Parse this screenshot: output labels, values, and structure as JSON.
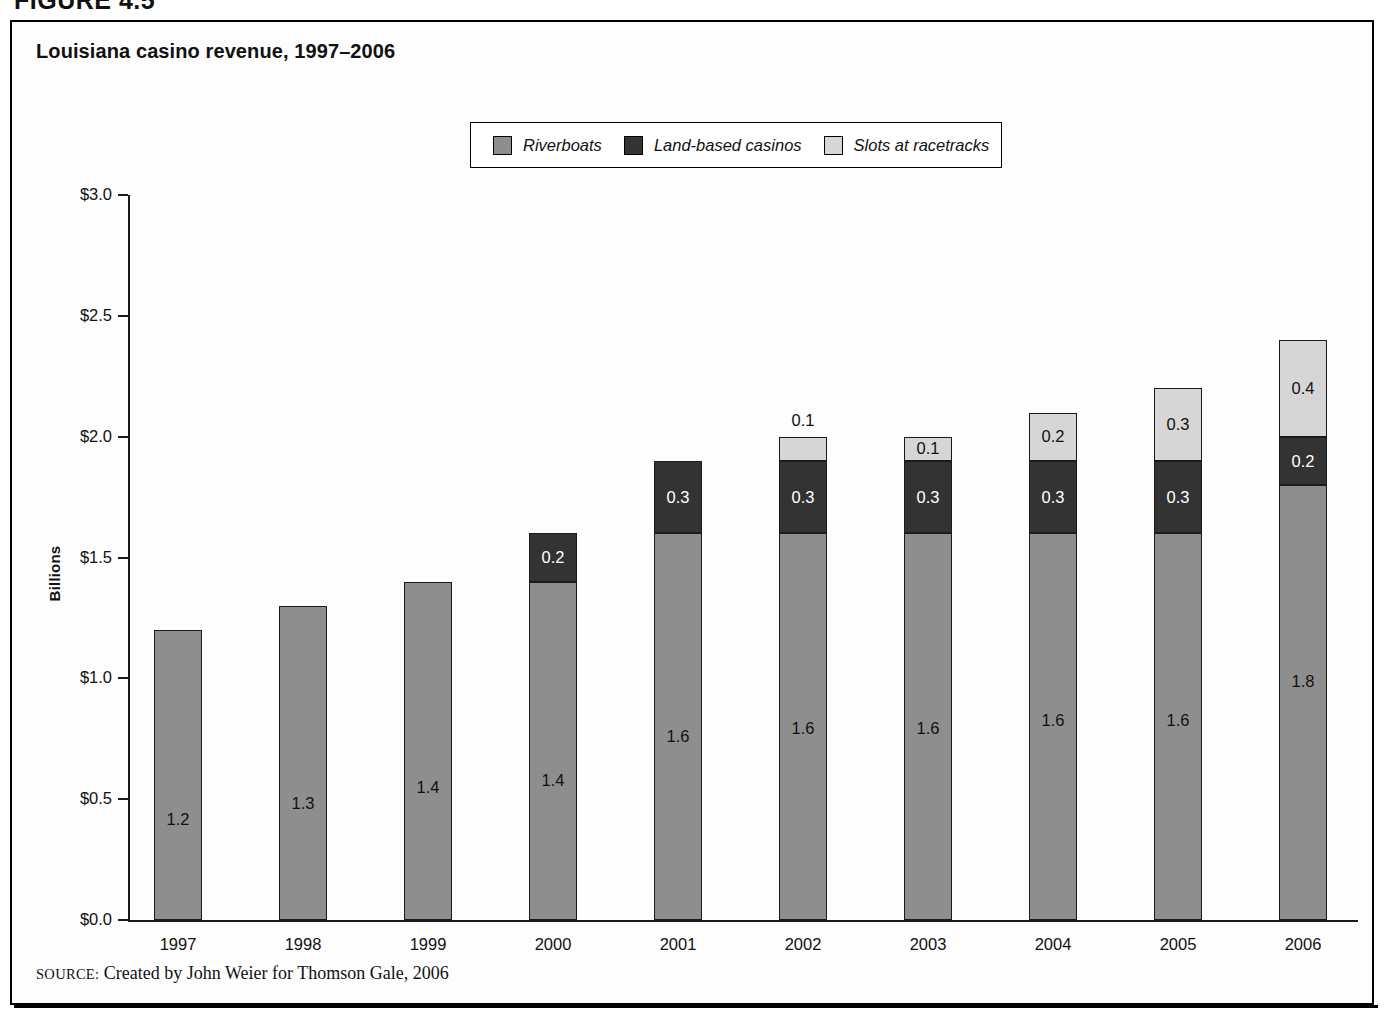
{
  "figure": {
    "label": "FIGURE 4.5",
    "title": "Louisiana casino revenue, 1997–2006",
    "source_word": "SOURCE:",
    "source_text": " Created by John Weier for Thomson Gale, 2006"
  },
  "colors": {
    "riverboats": "#8e8e8e",
    "land_based": "#333333",
    "slots": "#d6d6d6",
    "axis": "#1a1a1a",
    "frame": "#000000",
    "background": "#ffffff"
  },
  "legend": {
    "items": [
      {
        "label": "Riverboats",
        "key": "riverboats",
        "swatch": "#8e8e8e"
      },
      {
        "label": "Land-based casinos",
        "key": "land_based",
        "swatch": "#333333"
      },
      {
        "label": "Slots at racetracks",
        "key": "slots",
        "swatch": "#d6d6d6"
      }
    ]
  },
  "chart_data": {
    "type": "bar",
    "subtype": "stacked",
    "title": "Louisiana casino revenue, 1997–2006",
    "xlabel": "",
    "ylabel": "Billions",
    "ylim": [
      0.0,
      3.0
    ],
    "ytick_labels": [
      "$3.0",
      "$2.5",
      "$2.0",
      "$1.5",
      "$1.0",
      "$0.5",
      "$0.0"
    ],
    "ytick_values": [
      3.0,
      2.5,
      2.0,
      1.5,
      1.0,
      0.5,
      0.0
    ],
    "grid": false,
    "legend_position": "top-center",
    "categories": [
      "1997",
      "1998",
      "1999",
      "2000",
      "2001",
      "2002",
      "2003",
      "2004",
      "2005",
      "2006"
    ],
    "series": [
      {
        "name": "Riverboats",
        "values": [
          1.2,
          1.3,
          1.4,
          1.4,
          1.6,
          1.6,
          1.6,
          1.6,
          1.6,
          1.8
        ]
      },
      {
        "name": "Land-based casinos",
        "values": [
          0.0,
          0.0,
          0.0,
          0.2,
          0.3,
          0.3,
          0.3,
          0.3,
          0.3,
          0.2
        ]
      },
      {
        "name": "Slots at racetracks",
        "values": [
          0.0,
          0.0,
          0.0,
          0.0,
          0.0,
          0.1,
          0.1,
          0.2,
          0.3,
          0.4
        ]
      }
    ],
    "totals": [
      1.2,
      1.3,
      1.4,
      1.6,
      1.9,
      2.0,
      2.0,
      2.1,
      2.2,
      2.4
    ],
    "data_labels": [
      {
        "category": "1997",
        "segments": [
          {
            "series": "Riverboats",
            "text": "1.2",
            "placement": "inside"
          }
        ]
      },
      {
        "category": "1998",
        "segments": [
          {
            "series": "Riverboats",
            "text": "1.3",
            "placement": "inside"
          }
        ]
      },
      {
        "category": "1999",
        "segments": [
          {
            "series": "Riverboats",
            "text": "1.4",
            "placement": "inside"
          }
        ]
      },
      {
        "category": "2000",
        "segments": [
          {
            "series": "Riverboats",
            "text": "1.4",
            "placement": "inside"
          },
          {
            "series": "Land-based casinos",
            "text": "0.2",
            "placement": "inside"
          }
        ]
      },
      {
        "category": "2001",
        "segments": [
          {
            "series": "Riverboats",
            "text": "1.6",
            "placement": "inside"
          },
          {
            "series": "Land-based casinos",
            "text": "0.3",
            "placement": "inside"
          }
        ]
      },
      {
        "category": "2002",
        "segments": [
          {
            "series": "Riverboats",
            "text": "1.6",
            "placement": "inside"
          },
          {
            "series": "Land-based casinos",
            "text": "0.3",
            "placement": "inside"
          },
          {
            "series": "Slots at racetracks",
            "text": "0.1",
            "placement": "above"
          }
        ]
      },
      {
        "category": "2003",
        "segments": [
          {
            "series": "Riverboats",
            "text": "1.6",
            "placement": "inside"
          },
          {
            "series": "Land-based casinos",
            "text": "0.3",
            "placement": "inside"
          },
          {
            "series": "Slots at racetracks",
            "text": "0.1",
            "placement": "inside"
          }
        ]
      },
      {
        "category": "2004",
        "segments": [
          {
            "series": "Riverboats",
            "text": "1.6",
            "placement": "inside"
          },
          {
            "series": "Land-based casinos",
            "text": "0.3",
            "placement": "inside"
          },
          {
            "series": "Slots at racetracks",
            "text": "0.2",
            "placement": "inside"
          }
        ]
      },
      {
        "category": "2005",
        "segments": [
          {
            "series": "Riverboats",
            "text": "1.6",
            "placement": "inside"
          },
          {
            "series": "Land-based casinos",
            "text": "0.3",
            "placement": "inside"
          },
          {
            "series": "Slots at racetracks",
            "text": "0.3",
            "placement": "inside"
          }
        ]
      },
      {
        "category": "2006",
        "segments": [
          {
            "series": "Riverboats",
            "text": "1.8",
            "placement": "inside"
          },
          {
            "series": "Land-based casinos",
            "text": "0.2",
            "placement": "inside"
          },
          {
            "series": "Slots at racetracks",
            "text": "0.4",
            "placement": "inside"
          }
        ]
      }
    ]
  },
  "layout": {
    "plot_left": 128,
    "plot_right": 1358,
    "plot_top": 195,
    "plot_bottom": 920,
    "bar_width": 48,
    "first_center": 178,
    "center_step": 125
  }
}
